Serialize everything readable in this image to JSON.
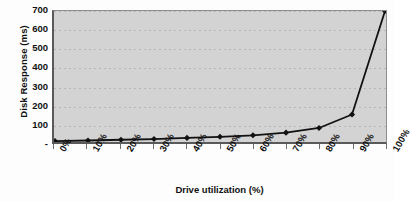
{
  "chart_data": {
    "type": "line",
    "title": "",
    "xlabel": "Drive utilization (%)",
    "ylabel": "Disk Response (ms)",
    "categories": [
      "0%",
      "10%",
      "20%",
      "30%",
      "40%",
      "50%",
      "60%",
      "70%",
      "80%",
      "90%",
      "100%"
    ],
    "x_values": [
      0,
      10,
      20,
      30,
      40,
      50,
      60,
      70,
      80,
      90,
      100
    ],
    "values": [
      5,
      8,
      12,
      16,
      22,
      28,
      36,
      50,
      75,
      147,
      700
    ],
    "ylim": [
      0,
      700
    ],
    "y_ticks": [
      0,
      100,
      200,
      300,
      400,
      500,
      600,
      700
    ],
    "y_tick_labels": [
      "-",
      "100",
      "200",
      "300",
      "400",
      "500",
      "600",
      "700"
    ],
    "grid": true,
    "grid_axis": "y",
    "legend": "none",
    "marker": "diamond",
    "series": [
      {
        "name": "Disk Response",
        "values": [
          5,
          8,
          12,
          16,
          22,
          28,
          36,
          50,
          75,
          147,
          700
        ]
      }
    ],
    "colors": {
      "plot_background": "#d3d3d3",
      "page_background": "#fdfdfd",
      "line": "#111111",
      "marker": "#111111",
      "axis": "#5a5a5a",
      "gridline": "#b3b3b3",
      "text": "#111111"
    }
  }
}
